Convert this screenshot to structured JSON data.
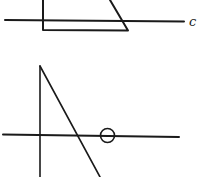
{
  "figures": [
    {
      "id": "top",
      "description": "Trapezoid cut by a horizontal line labeled c",
      "line_label": "c"
    },
    {
      "id": "bottom",
      "description": "Triangle (vertical side and diagonal) crossed by a horizontal line with a small circle on it"
    }
  ],
  "colors": {
    "stroke": "#1a1a1a",
    "background": "#ffffff"
  }
}
